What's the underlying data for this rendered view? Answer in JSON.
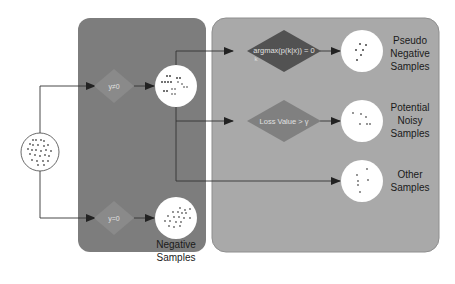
{
  "colors": {
    "background": "#ffffff",
    "left_panel": "#7d7d7d",
    "right_panel": "#a9a9a9",
    "diamond_dark": "#525252",
    "diamond_mid": "#808080",
    "diamond_gate": "#8a8a8a",
    "circle_fill": "#ffffff",
    "dot": "#555555",
    "line": "#333333",
    "label_text": "#1a1a1a",
    "diamond_text": "#e0e0e0"
  },
  "input": {
    "name": "all-samples"
  },
  "gates": {
    "non_zero": {
      "label": "y≠0"
    },
    "zero": {
      "label": "y=0"
    }
  },
  "left_outputs": {
    "negative": {
      "label_line1": "Negative",
      "label_line2": "Samples"
    }
  },
  "decisions": {
    "argmax": {
      "label": "argmax(p(k|x)) = 0",
      "subscript": "k"
    },
    "loss": {
      "label": "Loss Value > γ"
    }
  },
  "right_outputs": [
    {
      "id": "pseudo-negative",
      "lines": [
        "Pseudo",
        "Negative",
        "Samples"
      ]
    },
    {
      "id": "potential-noisy",
      "lines": [
        "Potential",
        "Noisy",
        "Samples"
      ]
    },
    {
      "id": "other",
      "lines": [
        "Other",
        "Samples"
      ]
    }
  ]
}
